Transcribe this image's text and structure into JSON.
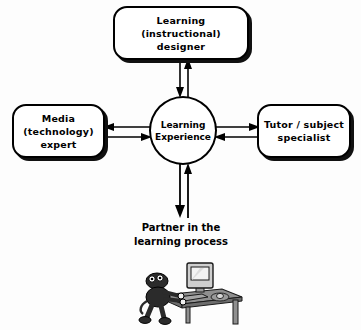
{
  "diagram": {
    "background_color": "#fdfdfd",
    "line_color": "#000000",
    "box_fill": "#ffffff",
    "shadow_color": "#111111",
    "nodes": {
      "designer": {
        "label": "Learning\n(instructional)\ndesigner",
        "shape": "rounded-rectangle",
        "position": "top"
      },
      "media": {
        "label": "Media\n(technology)\nexpert",
        "shape": "rounded-rectangle",
        "position": "left"
      },
      "tutor": {
        "label": "Tutor / subject\nspecialist",
        "shape": "rounded-rectangle",
        "position": "right"
      },
      "experience": {
        "label": "Learning\nExperience",
        "shape": "circle",
        "position": "center"
      }
    },
    "connectors": [
      {
        "name": "designer-experience",
        "from": "designer",
        "to": "experience",
        "style": "double-arrow",
        "orientation": "vertical"
      },
      {
        "name": "media-experience",
        "from": "media",
        "to": "experience",
        "style": "double-arrow",
        "orientation": "horizontal"
      },
      {
        "name": "tutor-experience",
        "from": "tutor",
        "to": "experience",
        "style": "double-arrow",
        "orientation": "horizontal"
      },
      {
        "name": "experience-partner",
        "from": "experience",
        "to": "partner",
        "style": "double-arrow",
        "orientation": "vertical"
      }
    ],
    "caption": {
      "text": "Partner in the\nlearning process"
    },
    "illustration": {
      "name": "learner-at-computer-desk",
      "description": "Cartoon figure seated at a desk with computer monitor, keyboard and mouse",
      "desk_color": "#8a8a8a",
      "monitor_color": "#cfcfcf",
      "figure_color": "#2b2b2b"
    }
  }
}
